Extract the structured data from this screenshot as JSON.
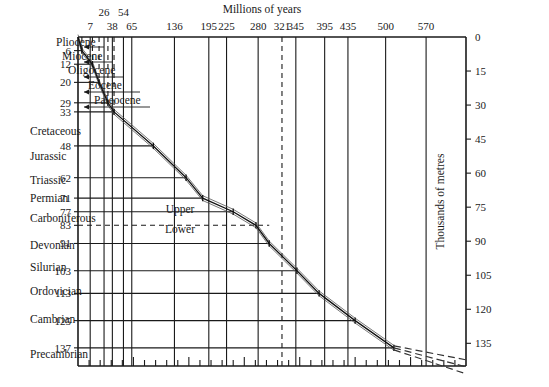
{
  "chart_data": {
    "type": "line",
    "xlabel": "Millions of years",
    "ylabel": "Thousands of metres",
    "xlim": [
      0,
      700
    ],
    "ylim": [
      0,
      145
    ],
    "grid": true,
    "legend": null,
    "x_axis": {
      "label": "Millions of years",
      "tick_labels": [
        "7",
        "26",
        "38",
        "54",
        "65",
        "136",
        "195",
        "225",
        "280",
        "321",
        "345",
        "395",
        "435",
        "500",
        "570"
      ],
      "tick_values": [
        7,
        26,
        38,
        54,
        65,
        136,
        195,
        225,
        280,
        321,
        345,
        395,
        435,
        500,
        570
      ],
      "dashed_tick": "321"
    },
    "y_axis_left": {
      "label": "",
      "tick_labels": [
        "6",
        "12",
        "20",
        "29",
        "33",
        "48",
        "62",
        "71",
        "77",
        "83",
        "91",
        "103",
        "113",
        "125",
        "137"
      ],
      "tick_values": [
        6,
        12,
        20,
        29,
        33,
        48,
        62,
        71,
        77,
        83,
        91,
        103,
        113,
        125,
        137
      ]
    },
    "y_axis_right": {
      "label": "Thousands of metres",
      "tick_labels": [
        "0",
        "15",
        "30",
        "45",
        "60",
        "75",
        "90",
        "105",
        "120",
        "135"
      ],
      "tick_values": [
        0,
        15,
        30,
        45,
        60,
        75,
        90,
        105,
        120,
        135
      ]
    },
    "epochs": [
      {
        "name": "Pliocene",
        "end_my": 7,
        "thickness_km": 6
      },
      {
        "name": "Miocene",
        "end_my": 26,
        "thickness_km": 12
      },
      {
        "name": "Oligocene",
        "end_my": 38,
        "thickness_km": 20
      },
      {
        "name": "Eocene",
        "end_my": 54,
        "thickness_km": 29
      },
      {
        "name": "Paleocene",
        "end_my": 65,
        "thickness_km": 33
      }
    ],
    "periods": [
      {
        "name": "Cretaceous",
        "end_my": 136,
        "thickness_km": 48
      },
      {
        "name": "Jurassic",
        "end_my": 195,
        "thickness_km": 62
      },
      {
        "name": "Triassic",
        "end_my": 225,
        "thickness_km": 71
      },
      {
        "name": "Permian",
        "end_my": 280,
        "thickness_km": 77
      },
      {
        "name": "Carboniferous",
        "end_my": 345,
        "thickness_km": 91,
        "subdivisions": [
          "Upper",
          "Lower"
        ],
        "split_my": 321,
        "split_thickness_km": 83
      },
      {
        "name": "Devonian",
        "end_my": 395,
        "thickness_km": 103
      },
      {
        "name": "Silurian",
        "end_my": 435,
        "thickness_km": 113
      },
      {
        "name": "Ordovician",
        "end_my": 500,
        "thickness_km": 125
      },
      {
        "name": "Cambrian",
        "end_my": 570,
        "thickness_km": 137
      },
      {
        "name": "Precambrian",
        "end_my": null,
        "thickness_km": null
      }
    ],
    "series": [
      {
        "name": "Cumulative strata thickness",
        "x": [
          7,
          26,
          38,
          54,
          65,
          136,
          195,
          225,
          280,
          321,
          345,
          395,
          435,
          500,
          570
        ],
        "y": [
          6,
          12,
          20,
          29,
          33,
          48,
          62,
          71,
          77,
          83,
          91,
          103,
          113,
          125,
          137
        ]
      }
    ],
    "extrapolation": {
      "style": "dashed",
      "description": "Three dashed lines extending beyond 570 Ma past 137 thousand metres"
    }
  },
  "axes": {
    "top_title": "Millions of years",
    "right_title": "Thousands of metres"
  },
  "top_ticks": [
    {
      "label": "7",
      "x": 22,
      "row": 1,
      "dashed": false
    },
    {
      "label": "26",
      "x": 47,
      "row": 0,
      "dashed": false
    },
    {
      "label": "38",
      "x": 62,
      "row": 1,
      "dashed": false
    },
    {
      "label": "54",
      "x": 82,
      "row": 0,
      "dashed": false
    },
    {
      "label": "65",
      "x": 97,
      "row": 1,
      "dashed": false
    },
    {
      "label": "136",
      "x": 174,
      "row": 1,
      "dashed": false
    },
    {
      "label": "195",
      "x": 236,
      "row": 1,
      "dashed": false
    },
    {
      "label": "225",
      "x": 268,
      "row": 1,
      "dashed": false
    },
    {
      "label": "280",
      "x": 325,
      "row": 1,
      "dashed": false
    },
    {
      "label": "321",
      "x": 368,
      "row": 1,
      "dashed": true
    },
    {
      "label": "345",
      "x": 393,
      "row": 1,
      "dashed": false
    },
    {
      "label": "395",
      "x": 445,
      "row": 1,
      "dashed": false
    },
    {
      "label": "435",
      "x": 487,
      "row": 1,
      "dashed": false
    },
    {
      "label": "500",
      "x": 555,
      "row": 1,
      "dashed": false
    },
    {
      "label": "570",
      "x": 628,
      "row": 1,
      "dashed": false
    }
  ],
  "left_ticks": [
    {
      "label": "6",
      "y": 6
    },
    {
      "label": "12",
      "y": 12
    },
    {
      "label": "20",
      "y": 20
    },
    {
      "label": "29",
      "y": 29
    },
    {
      "label": "33",
      "y": 33
    },
    {
      "label": "48",
      "y": 48
    },
    {
      "label": "62",
      "y": 62
    },
    {
      "label": "71",
      "y": 71
    },
    {
      "label": "77",
      "y": 77
    },
    {
      "label": "83",
      "y": 83
    },
    {
      "label": "91",
      "y": 91
    },
    {
      "label": "103",
      "y": 103
    },
    {
      "label": "113",
      "y": 113
    },
    {
      "label": "125",
      "y": 125
    },
    {
      "label": "137",
      "y": 137
    }
  ],
  "right_ticks": [
    {
      "label": "0",
      "y": 0
    },
    {
      "label": "15",
      "y": 15
    },
    {
      "label": "30",
      "y": 30
    },
    {
      "label": "45",
      "y": 45
    },
    {
      "label": "60",
      "y": 60
    },
    {
      "label": "75",
      "y": 75
    },
    {
      "label": "90",
      "y": 90
    },
    {
      "label": "105",
      "y": 105
    },
    {
      "label": "120",
      "y": 120
    },
    {
      "label": "135",
      "y": 135
    }
  ],
  "epoch_labels": [
    {
      "name": "Pliocene",
      "lx": 56,
      "ly": 46
    },
    {
      "name": "Miocene",
      "lx": 62,
      "ly": 60
    },
    {
      "name": "Oligocene",
      "lx": 68,
      "ly": 74
    },
    {
      "name": "Eocene",
      "lx": 88,
      "ly": 89
    },
    {
      "name": "Paleocene",
      "lx": 94,
      "ly": 104
    }
  ],
  "period_labels": [
    {
      "name": "Cretaceous",
      "lx": 30,
      "ly": 135
    },
    {
      "name": "Jurassic",
      "lx": 30,
      "ly": 160
    },
    {
      "name": "Triassic",
      "lx": 30,
      "ly": 184
    },
    {
      "name": "Permian",
      "lx": 30,
      "ly": 202
    },
    {
      "name": "Carboniferous",
      "lx": 30,
      "ly": 222
    },
    {
      "name": "Devonian",
      "lx": 30,
      "ly": 249
    },
    {
      "name": "Silurian",
      "lx": 30,
      "ly": 271
    },
    {
      "name": "Ordovician",
      "lx": 30,
      "ly": 295
    },
    {
      "name": "Cambrian",
      "lx": 30,
      "ly": 323
    },
    {
      "name": "Precambrian",
      "lx": 30,
      "ly": 358
    }
  ],
  "subdivision_labels": [
    {
      "name": "Upper",
      "lx": 180,
      "ly": 213
    },
    {
      "name": "Lower",
      "lx": 180,
      "ly": 233
    }
  ],
  "colors": {
    "ink": "#1a1a1a",
    "background": "#ffffff",
    "curve": "#111111"
  }
}
